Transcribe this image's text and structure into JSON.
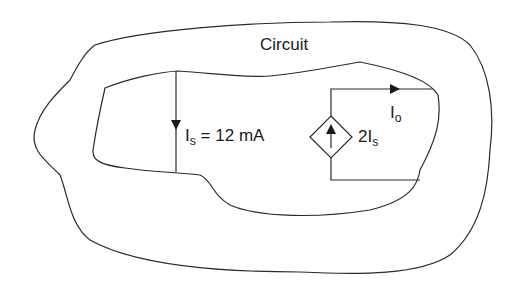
{
  "diagram": {
    "title": "Circuit",
    "source_current": {
      "symbol": "I",
      "subscript": "s",
      "value_text": "= 12 mA"
    },
    "output_current": {
      "symbol": "I",
      "subscript": "o"
    },
    "dependent_source": {
      "coefficient": "2I",
      "subscript": "s",
      "shape": "diamond-current-source",
      "arrow_direction": "up"
    },
    "colors": {
      "stroke": "#2a2a2a",
      "background": "#ffffff"
    }
  }
}
